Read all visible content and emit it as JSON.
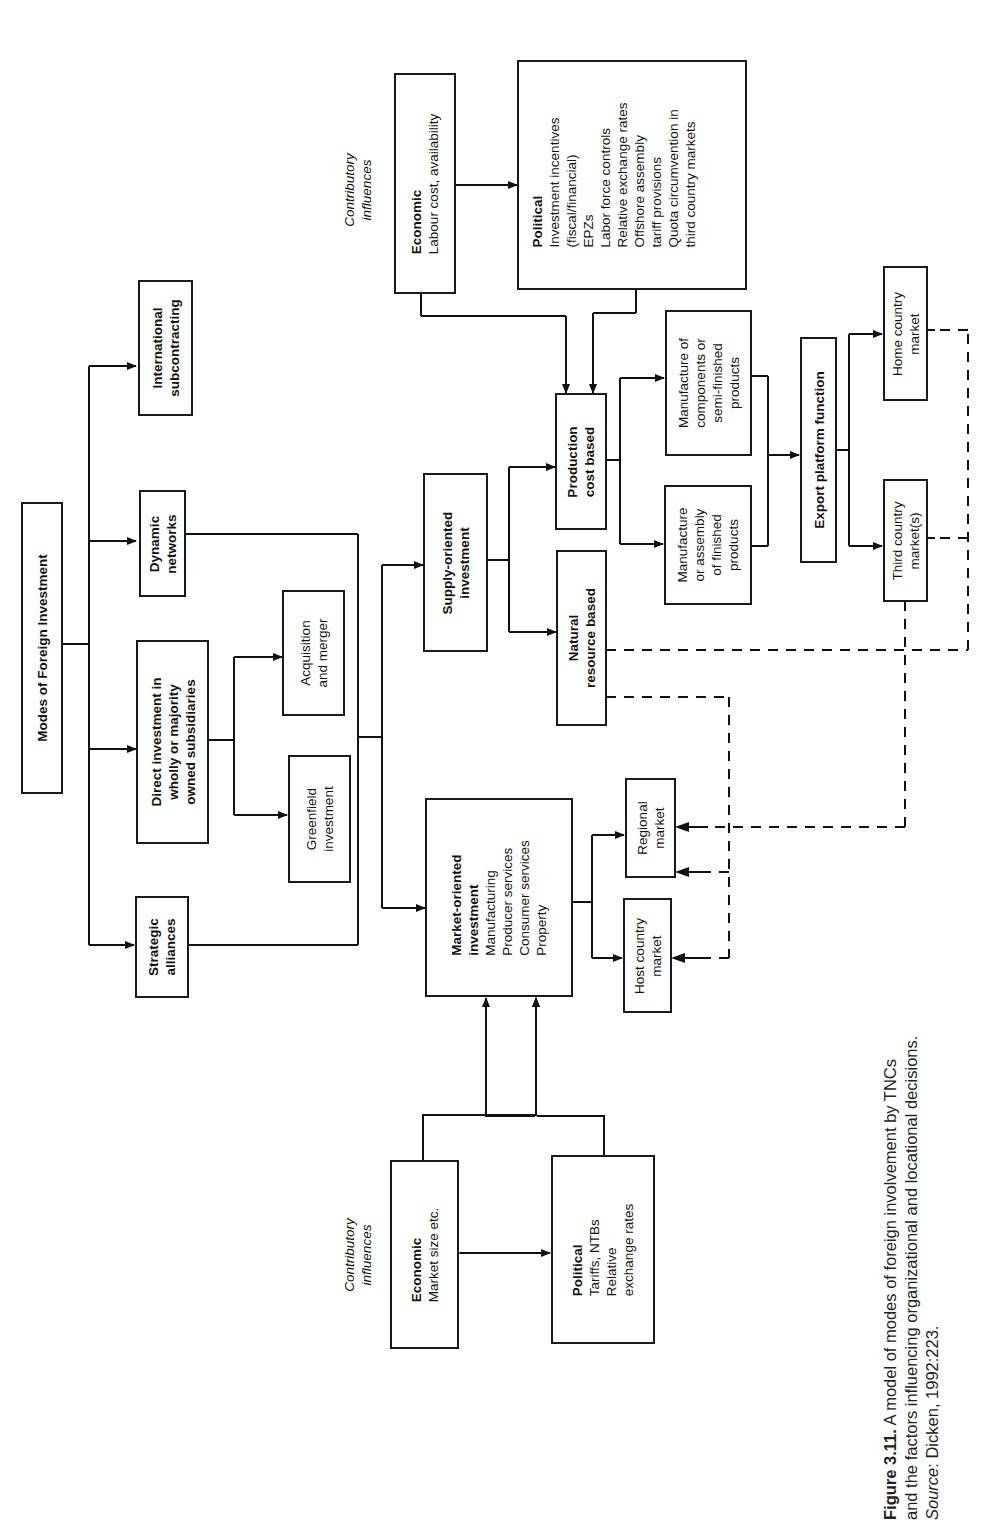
{
  "diagram": {
    "root": {
      "label": "Modes of Foreign Investment"
    },
    "modes": [
      {
        "id": "subcontracting",
        "label": "International subcontracting",
        "lines": [
          "International",
          "subcontracting"
        ]
      },
      {
        "id": "networks",
        "label": "Dynamic networks",
        "lines": [
          "Dynamic",
          "networks"
        ]
      },
      {
        "id": "direct",
        "label": "Direct investment in wholly or majority owned subsidiaries",
        "lines": [
          "Direct investment in",
          "wholly or majority",
          "owned subsidiaries"
        ]
      },
      {
        "id": "alliances",
        "label": "Strategic alliances",
        "lines": [
          "Strategic",
          "alliances"
        ]
      }
    ],
    "direct_children": [
      {
        "id": "acquisition",
        "lines": [
          "Acquisition",
          "and merger"
        ]
      },
      {
        "id": "greenfield",
        "lines": [
          "Greenfield",
          "investment"
        ]
      }
    ],
    "supply": {
      "lines": [
        "Supply-oriented",
        "investment"
      ]
    },
    "production": {
      "lines": [
        "Production",
        "cost based"
      ]
    },
    "natural": {
      "lines": [
        "Natural",
        "resource based"
      ]
    },
    "components": {
      "lines": [
        "Manufacture of",
        "components or",
        "semi-finished",
        "products"
      ]
    },
    "finished": {
      "lines": [
        "Manufacture",
        "or assembly",
        "of finished",
        "products"
      ]
    },
    "export": {
      "label": "Export platform function"
    },
    "home_market": {
      "lines": [
        "Home country",
        "market"
      ]
    },
    "third_market": {
      "lines": [
        "Third country",
        "market(s)"
      ]
    },
    "market_oriented": {
      "title": [
        "Market-oriented",
        "investment"
      ],
      "items": [
        "Manufacturing",
        "Producer services",
        "Consumer services",
        "Property"
      ]
    },
    "host_market": {
      "lines": [
        "Host country",
        "market"
      ]
    },
    "regional_market": {
      "lines": [
        "Regional",
        "market"
      ]
    },
    "supply_influences": {
      "label": [
        "Contributory",
        "influences"
      ],
      "economic": {
        "title": "Economic",
        "items": [
          "Labour cost, availability"
        ]
      },
      "political": {
        "title": "Political",
        "items": [
          "Investment incentives",
          "(fiscal/financial)",
          "EPZs",
          "Labor force controls",
          "Relative exchange rates",
          "Offshore assembly",
          "tariff provisions",
          "Quota circumvention in",
          "third country markets"
        ]
      }
    },
    "market_influences": {
      "label": [
        "Contributory",
        "influences"
      ],
      "economic": {
        "title": "Economic",
        "items": [
          "Market size etc."
        ]
      },
      "political": {
        "title": "Political",
        "items": [
          "Tariffs, NTBs",
          "Relative",
          "exchange rates"
        ]
      }
    }
  },
  "caption": {
    "figure": "Figure 3.11.",
    "line1": " A model of modes of foreign involvement by TNCs",
    "line2": "and the factors influencing organizational and locational decisions.",
    "source_label": "Source",
    "source_text": ": Dicken, 1992:223."
  }
}
